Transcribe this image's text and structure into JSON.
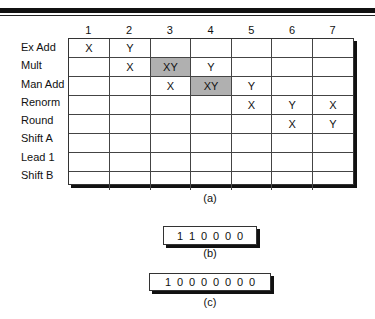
{
  "figure": {
    "table": {
      "column_headers": [
        "1",
        "2",
        "3",
        "4",
        "5",
        "6",
        "7"
      ],
      "rows": [
        {
          "label": "Ex Add",
          "cells": [
            "X",
            "Y",
            "",
            "",
            "",
            "",
            ""
          ],
          "shaded": [
            false,
            false,
            false,
            false,
            false,
            false,
            false
          ]
        },
        {
          "label": "Mult",
          "cells": [
            "",
            "X",
            "XY",
            "Y",
            "",
            "",
            ""
          ],
          "shaded": [
            false,
            false,
            true,
            false,
            false,
            false,
            false
          ]
        },
        {
          "label": "Man Add",
          "cells": [
            "",
            "",
            "X",
            "XY",
            "Y",
            "",
            ""
          ],
          "shaded": [
            false,
            false,
            false,
            true,
            false,
            false,
            false
          ]
        },
        {
          "label": "Renorm",
          "cells": [
            "",
            "",
            "",
            "",
            "X",
            "Y",
            "X"
          ],
          "shaded": [
            false,
            false,
            false,
            false,
            false,
            false,
            false
          ]
        },
        {
          "label": "Round",
          "cells": [
            "",
            "",
            "",
            "",
            "",
            "X",
            "Y"
          ],
          "shaded": [
            false,
            false,
            false,
            false,
            false,
            false,
            false
          ]
        },
        {
          "label": "Shift A",
          "cells": [
            "",
            "",
            "",
            "",
            "",
            "",
            ""
          ],
          "shaded": [
            false,
            false,
            false,
            false,
            false,
            false,
            false
          ]
        },
        {
          "label": "Lead 1",
          "cells": [
            "",
            "",
            "",
            "",
            "",
            "",
            ""
          ],
          "shaded": [
            false,
            false,
            false,
            false,
            false,
            false,
            false
          ]
        },
        {
          "label": "Shift B",
          "cells": [
            "",
            "",
            "",
            "",
            "",
            "",
            ""
          ],
          "shaded": [
            false,
            false,
            false,
            false,
            false,
            false,
            false
          ]
        }
      ],
      "caption": "(a)",
      "shade_color": "#b0b0b0"
    },
    "vector_b": {
      "bits": [
        "1",
        "1",
        "0",
        "0",
        "0",
        "0"
      ],
      "caption": "(b)"
    },
    "vector_c": {
      "bits": [
        "1",
        "0",
        "0",
        "0",
        "0",
        "0",
        "0",
        "0"
      ],
      "caption": "(c)"
    }
  }
}
